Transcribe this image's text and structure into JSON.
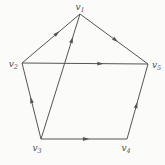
{
  "diagram": {
    "type": "directed-graph",
    "background": "#fbfbfa",
    "edge_color": "#555557",
    "label_color": "#4f4f52",
    "vertices": [
      {
        "id": "v1",
        "base": "v",
        "sub": "1",
        "x": 80,
        "y": 14,
        "lx": 80,
        "ly": 10,
        "anchor": "middle"
      },
      {
        "id": "v2",
        "base": "v",
        "sub": "2",
        "x": 22,
        "y": 63,
        "lx": 18,
        "ly": 67,
        "anchor": "end"
      },
      {
        "id": "v3",
        "base": "v",
        "sub": "3",
        "x": 41,
        "y": 139,
        "lx": 37,
        "ly": 151,
        "anchor": "middle"
      },
      {
        "id": "v4",
        "base": "v",
        "sub": "4",
        "x": 127,
        "y": 139,
        "lx": 126,
        "ly": 151,
        "anchor": "middle"
      },
      {
        "id": "v5",
        "base": "v",
        "sub": "5",
        "x": 148,
        "y": 64,
        "lx": 152,
        "ly": 68,
        "anchor": "start"
      }
    ],
    "edges": [
      {
        "from": "v2",
        "to": "v1",
        "t": 0.6
      },
      {
        "from": "v1",
        "to": "v5",
        "t": 0.52
      },
      {
        "from": "v2",
        "to": "v5",
        "t": 0.62
      },
      {
        "from": "v3",
        "to": "v2",
        "t": 0.51
      },
      {
        "from": "v3",
        "to": "v4",
        "t": 0.52
      },
      {
        "from": "v4",
        "to": "v5",
        "t": 0.45
      },
      {
        "from": "v3",
        "to": "v1",
        "t": 0.79
      }
    ]
  }
}
